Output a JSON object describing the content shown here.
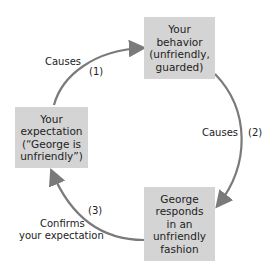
{
  "diagram": {
    "type": "cycle",
    "nodes": [
      {
        "id": "behavior",
        "lines": [
          "Your",
          "behavior",
          "(unfriendly,",
          "guarded)"
        ]
      },
      {
        "id": "response",
        "lines": [
          "George",
          "responds",
          "in an",
          "unfriendly",
          "fashion"
        ]
      },
      {
        "id": "expectation",
        "lines": [
          "Your",
          "expectation",
          "(“George is",
          "unfriendly”)"
        ]
      }
    ],
    "edges": [
      {
        "from": "expectation",
        "to": "behavior",
        "label": "Causes",
        "step": "(1)"
      },
      {
        "from": "behavior",
        "to": "response",
        "label": "Causes",
        "step": "(2)"
      },
      {
        "from": "response",
        "to": "expectation",
        "label_line1": "Confirms",
        "label_line2": "your expectation",
        "step": "(3)"
      }
    ]
  },
  "colors": {
    "box_fill": "#d4d4d4",
    "arrow": "#7a7a7a",
    "text": "#222222"
  }
}
